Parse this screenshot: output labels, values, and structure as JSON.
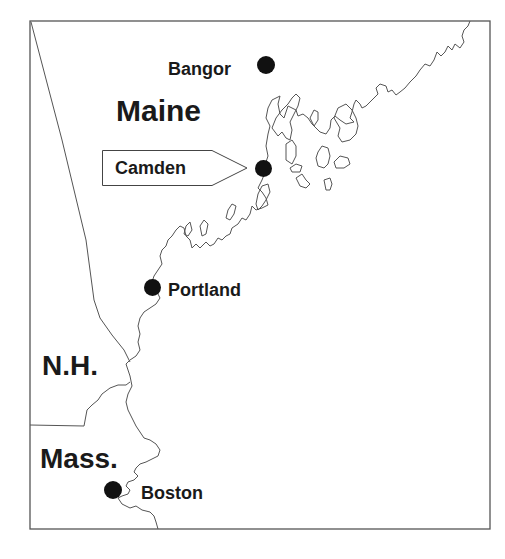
{
  "map": {
    "title": "",
    "colors": {
      "background": "#ffffff",
      "ink": "#111111",
      "line": "#555555"
    },
    "states": [
      {
        "id": "maine",
        "label": "Maine"
      },
      {
        "id": "nh",
        "label": "N.H."
      },
      {
        "id": "mass",
        "label": "Mass."
      }
    ],
    "cities": [
      {
        "id": "bangor",
        "label": "Bangor"
      },
      {
        "id": "camden",
        "label": "Camden",
        "highlighted": true
      },
      {
        "id": "portland",
        "label": "Portland"
      },
      {
        "id": "boston",
        "label": "Boston"
      }
    ],
    "callout": {
      "label": "Camden",
      "shape": "arrow-pointer-right"
    }
  }
}
